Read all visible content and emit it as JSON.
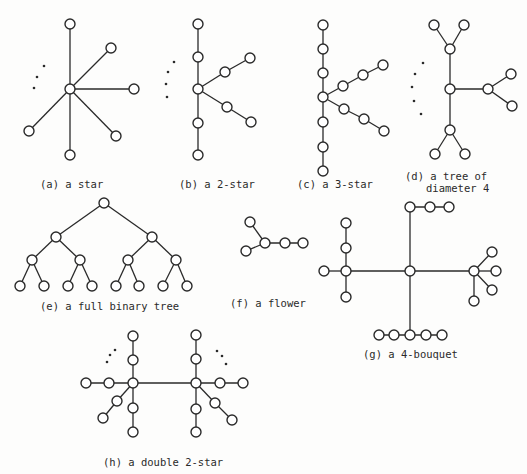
{
  "figures": [
    {
      "id": "a",
      "caption": "(a) a star"
    },
    {
      "id": "b",
      "caption": "(b) a 2-star"
    },
    {
      "id": "c",
      "caption": "(c) a 3-star"
    },
    {
      "id": "d",
      "caption_line1": "(d) a tree of",
      "caption_line2": "diameter 4"
    },
    {
      "id": "e",
      "caption": "(e) a full binary tree"
    },
    {
      "id": "f",
      "caption": "(f) a flower"
    },
    {
      "id": "g",
      "caption": "(g) a 4-bouquet"
    },
    {
      "id": "h",
      "caption": "(h) a double 2-star"
    }
  ],
  "colors": {
    "ink": "#2a2a2a",
    "background": "#fdfdfc"
  }
}
